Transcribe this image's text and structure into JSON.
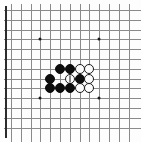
{
  "figure": {
    "kind": "go-board-diagram",
    "width": 141,
    "height": 142,
    "background_color": "#fdfdfd"
  },
  "board": {
    "columns": 13,
    "rows": 13,
    "origin_x": 11,
    "origin_y": 10,
    "cell_size": 9.8,
    "line_color": "#8a8a8a",
    "edge_color": "#2b2b2b",
    "left_edge_visible": true,
    "grid_cropped_right": true,
    "grid_cropped_bottom": true,
    "star_point_color": "#1a1a1a",
    "star_points": [
      {
        "col": 3,
        "row": 3
      },
      {
        "col": 9,
        "row": 3
      },
      {
        "col": 3,
        "row": 9
      },
      {
        "col": 9,
        "row": 9
      }
    ]
  },
  "stones": {
    "black_color": "#0d0d0d",
    "white_color": "#fcfcfc",
    "outline_color": "#1a1a1a",
    "diameter": 10,
    "black_count": 8,
    "white_count": 5,
    "list": [
      {
        "color": "black",
        "col": 5,
        "row": 6,
        "mark": ""
      },
      {
        "color": "black",
        "col": 6,
        "row": 6,
        "mark": ""
      },
      {
        "color": "white",
        "col": 7,
        "row": 6,
        "mark": ""
      },
      {
        "color": "white",
        "col": 8,
        "row": 6,
        "mark": ""
      },
      {
        "color": "black",
        "col": 4,
        "row": 7,
        "mark": ""
      },
      {
        "color": "white",
        "col": 6,
        "row": 7,
        "mark": "line"
      },
      {
        "color": "black",
        "col": 7,
        "row": 7,
        "mark": ""
      },
      {
        "color": "white",
        "col": 8,
        "row": 7,
        "mark": ""
      },
      {
        "color": "black",
        "col": 4,
        "row": 8,
        "mark": ""
      },
      {
        "color": "black",
        "col": 5,
        "row": 8,
        "mark": ""
      },
      {
        "color": "black",
        "col": 6,
        "row": 8,
        "mark": ""
      },
      {
        "color": "white",
        "col": 7,
        "row": 8,
        "mark": ""
      },
      {
        "color": "white",
        "col": 8,
        "row": 8,
        "mark": ""
      }
    ]
  },
  "labels": {
    "caption": ""
  }
}
